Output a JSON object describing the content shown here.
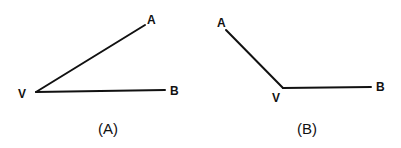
{
  "diagram": {
    "type": "angle-comparison",
    "stroke_color": "#111111",
    "background_color": "#ffffff",
    "panels": [
      {
        "id": "A",
        "caption": "(A)",
        "vertex_label": "V",
        "ray1_label": "A",
        "ray2_label": "B",
        "description": "acute angle AVB with vertex on the left"
      },
      {
        "id": "B",
        "caption": "(B)",
        "vertex_label": "V",
        "ray1_label": "A",
        "ray2_label": "B",
        "description": "obtuse angle AVB with vertex in the middle-bottom"
      }
    ]
  }
}
